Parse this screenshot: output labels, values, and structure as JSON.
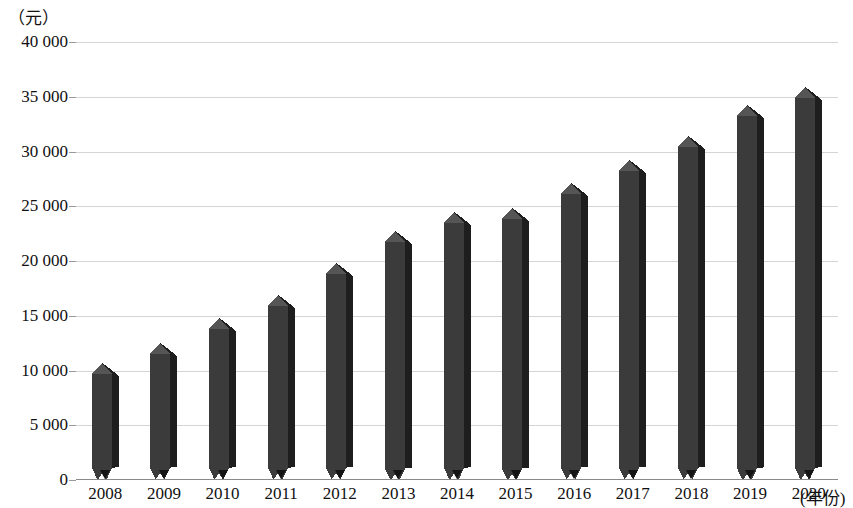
{
  "chart_data": {
    "type": "bar",
    "title": "",
    "subtitle": "",
    "xlabel": "(年份)",
    "ylabel": "（元）",
    "categories": [
      "2008",
      "2009",
      "2010",
      "2011",
      "2012",
      "2013",
      "2014",
      "2015",
      "2016",
      "2017",
      "2018",
      "2019",
      "2020"
    ],
    "values": [
      10500,
      12300,
      14600,
      16700,
      19600,
      22600,
      24300,
      24700,
      26900,
      29000,
      31200,
      34100,
      35700
    ],
    "ytick_labels": [
      "40 000",
      "35 000",
      "30 000",
      "25 000",
      "20 000",
      "15 000",
      "10 000",
      "5 000",
      "0"
    ],
    "ytick_values": [
      40000,
      35000,
      30000,
      25000,
      20000,
      15000,
      10000,
      5000,
      0
    ],
    "ylim": [
      0,
      40000
    ],
    "grid": true,
    "legend": null,
    "legend_position": "none",
    "series": [
      {
        "name": "",
        "values": [
          10500,
          12300,
          14600,
          16700,
          19600,
          22600,
          24300,
          24700,
          26900,
          29000,
          31200,
          34100,
          35700
        ]
      }
    ],
    "colors": {
      "bar_face": "#3b3b3b",
      "bar_side": "#1e1e1e",
      "bar_top": "#555555",
      "gridline": "#d4d4d4",
      "axis": "#8a8a8a",
      "text": "#111111"
    }
  }
}
